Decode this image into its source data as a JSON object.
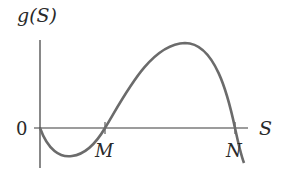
{
  "diagram": {
    "y_axis_label": "g(S)",
    "x_axis_label": "S",
    "origin_label": "0",
    "points": [
      {
        "label": "M",
        "description": "first positive root of g(S)"
      },
      {
        "label": "N",
        "description": "second positive root of g(S)"
      }
    ],
    "curve": "cubic-like curve starting at origin, dipping below axis, crossing at M, peaking, then crossing at N and decreasing",
    "colors": {
      "axis": "#3a3a3a",
      "curve": "#6b6b6b",
      "text": "#2a2a2a"
    }
  }
}
